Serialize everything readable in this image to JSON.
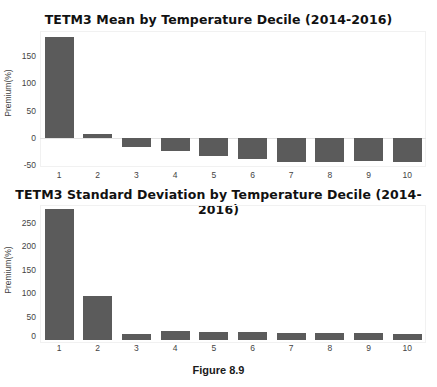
{
  "chart_data": [
    {
      "type": "bar",
      "title": "TETM3 Mean by Temperature Decile (2014-2016)",
      "xlabel": "",
      "ylabel": "Premium(%)",
      "categories": [
        "1",
        "2",
        "3",
        "4",
        "5",
        "6",
        "7",
        "8",
        "9",
        "10"
      ],
      "values": [
        187,
        8,
        -17,
        -24,
        -33,
        -39,
        -44,
        -44,
        -43,
        -44
      ],
      "yticks": [
        "150",
        "100",
        "50",
        "0",
        "-50"
      ],
      "ylim": [
        -52,
        197
      ],
      "grid": false,
      "legend": null,
      "bar_color": "#5b5b5b"
    },
    {
      "type": "bar",
      "title": "TETM3 Standard Deviation by Temperature Decile (2014-2016)",
      "xlabel": "",
      "ylabel": "Premium(%)",
      "categories": [
        "1",
        "2",
        "3",
        "4",
        "5",
        "6",
        "7",
        "8",
        "9",
        "10"
      ],
      "values": [
        279,
        94,
        13,
        20,
        17,
        17,
        15,
        14,
        14,
        12
      ],
      "yticks": [
        "250",
        "200",
        "150",
        "100",
        "50",
        "0"
      ],
      "ylim": [
        -4,
        287
      ],
      "grid": false,
      "legend": null,
      "bar_color": "#5b5b5b"
    }
  ],
  "caption": "Figure 8.9"
}
